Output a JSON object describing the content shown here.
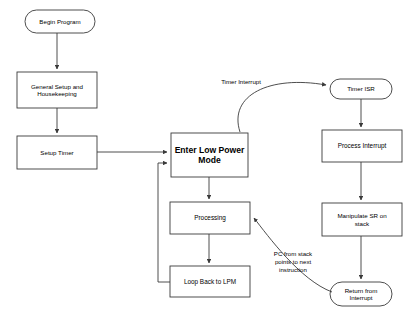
{
  "diagram": {
    "background_color": "#ffffff",
    "stroke_color": "#3a3a3a",
    "text_color": "#000000"
  },
  "nodes": {
    "begin_program": {
      "label": "Begin Program",
      "shape": "terminator"
    },
    "general_setup": {
      "label": "General Setup and\nHousekeeping",
      "shape": "process"
    },
    "setup_timer": {
      "label": "Setup Timer",
      "shape": "process"
    },
    "enter_lpm": {
      "label": "Enter Low Power\nMode",
      "shape": "process"
    },
    "processing": {
      "label": "Processing",
      "shape": "process"
    },
    "loop_back": {
      "label": "Loop Back to LPM",
      "shape": "process"
    },
    "timer_isr": {
      "label": "Timer ISR",
      "shape": "terminator"
    },
    "process_interrupt": {
      "label": "Process Interrupt",
      "shape": "process"
    },
    "manipulate_sr": {
      "label": "Manipulate SR on\nstack",
      "shape": "process"
    },
    "return_from_interrupt": {
      "label": "Return from\nInterrupt",
      "shape": "terminator"
    }
  },
  "edge_labels": {
    "timer_interrupt": "Timer Interrupt",
    "pc_from_stack": "PC from stack\npoints to next\ninstruction"
  }
}
